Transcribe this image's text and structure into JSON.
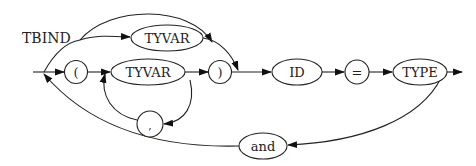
{
  "diagram": {
    "title": "TBIND",
    "type": "railroad / syntax diagram",
    "nodes": {
      "lparen": {
        "label": "(",
        "shape": "circle"
      },
      "tyvar_top": {
        "label": "TYVAR",
        "shape": "ellipse"
      },
      "tyvar_mid": {
        "label": "TYVAR",
        "shape": "ellipse"
      },
      "comma": {
        "label": ",",
        "shape": "circle"
      },
      "rparen": {
        "label": ")",
        "shape": "circle"
      },
      "id": {
        "label": "ID",
        "shape": "ellipse"
      },
      "eq": {
        "label": "=",
        "shape": "circle"
      },
      "type": {
        "label": "TYPE",
        "shape": "ellipse"
      },
      "and": {
        "label": "and",
        "shape": "ellipse"
      }
    },
    "edges": [
      {
        "from": "start",
        "to": "tyvar_top"
      },
      {
        "from": "start",
        "to": "id",
        "note": "bypass arc over TYVAR"
      },
      {
        "from": "start",
        "to": "lparen"
      },
      {
        "from": "lparen",
        "to": "tyvar_mid"
      },
      {
        "from": "tyvar_mid",
        "to": "rparen"
      },
      {
        "from": "tyvar_mid",
        "to": "comma"
      },
      {
        "from": "comma",
        "to": "tyvar_mid"
      },
      {
        "from": "tyvar_top",
        "to": "id"
      },
      {
        "from": "rparen",
        "to": "id"
      },
      {
        "from": "id",
        "to": "eq"
      },
      {
        "from": "eq",
        "to": "type"
      },
      {
        "from": "type",
        "to": "end"
      },
      {
        "from": "type",
        "to": "and"
      },
      {
        "from": "and",
        "to": "start"
      }
    ]
  }
}
